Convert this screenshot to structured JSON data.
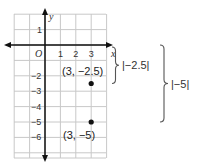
{
  "graph": {
    "axis_x_label": "x",
    "axis_y_label": "y",
    "origin_label": "O",
    "x_ticks": [
      "1",
      "2",
      "3"
    ],
    "y_ticks_pos": [
      "1"
    ],
    "y_ticks_neg": [
      "-2",
      "-3",
      "-4",
      "-5",
      "-6"
    ],
    "x_range": [
      -2,
      4
    ],
    "y_range": [
      -7,
      2
    ]
  },
  "points": [
    {
      "x": 3,
      "y": -2.5,
      "label": "(3, −2.5)"
    },
    {
      "x": 3,
      "y": -5,
      "label": "(3, −5)"
    }
  ],
  "braces": [
    {
      "label": "|−2.5|"
    },
    {
      "label": "|−5|"
    }
  ],
  "colors": {
    "grid": "#c8c8c8",
    "axis": "#111111",
    "point": "#111111",
    "brace": "#555555"
  }
}
